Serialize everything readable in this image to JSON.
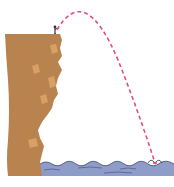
{
  "diagram": {
    "elements": {
      "cliff": {
        "label": "cliff",
        "color": "#B8834F",
        "highlight_color": "#D9A066"
      },
      "diver": {
        "label": "diver on cliff edge",
        "color": "#333333"
      },
      "trajectory": {
        "label": "parabolic trajectory",
        "style": "dashed",
        "color": "#E0507A"
      },
      "water": {
        "label": "water surface",
        "color": "#8E9CC8",
        "wave_color": "#3F4A7A"
      },
      "splash": {
        "label": "diver entering water"
      }
    },
    "colors": {
      "background": "#FFFFFF"
    }
  }
}
